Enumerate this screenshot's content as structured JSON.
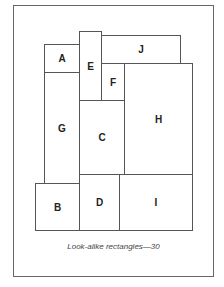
{
  "caption": "Look-alike rectangles—30",
  "rectangles": [
    {
      "label": "A",
      "x": 44,
      "y": 44,
      "w": 36,
      "h": 29
    },
    {
      "label": "E",
      "x": 79,
      "y": 31,
      "w": 23,
      "h": 70
    },
    {
      "label": "J",
      "x": 101,
      "y": 35,
      "w": 80,
      "h": 29
    },
    {
      "label": "F",
      "x": 101,
      "y": 63,
      "w": 24,
      "h": 38
    },
    {
      "label": "H",
      "x": 124,
      "y": 63,
      "w": 69,
      "h": 112
    },
    {
      "label": "G",
      "x": 44,
      "y": 72,
      "w": 36,
      "h": 112
    },
    {
      "label": "C",
      "x": 79,
      "y": 100,
      "w": 46,
      "h": 75
    },
    {
      "label": "B",
      "x": 35,
      "y": 183,
      "w": 45,
      "h": 48
    },
    {
      "label": "D",
      "x": 79,
      "y": 174,
      "w": 41,
      "h": 57
    },
    {
      "label": "I",
      "x": 119,
      "y": 174,
      "w": 74,
      "h": 57
    }
  ]
}
